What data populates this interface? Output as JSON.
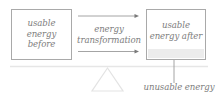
{
  "diagram": {
    "left_box": {
      "lines": [
        "usable",
        "energy",
        "before"
      ]
    },
    "middle": {
      "lines": [
        "energy",
        "transformation"
      ]
    },
    "right_box": {
      "lines": [
        "usable",
        "energy after"
      ]
    },
    "bottom_label": "unusable energy",
    "colors": {
      "text": "#7d7d7d",
      "box_border": "#a9a9a9",
      "arrow": "#9a9a9a",
      "ground": "#e6e6e6",
      "unusable_strip": "#ececec",
      "fulcrum": "#e3e3e3"
    }
  }
}
